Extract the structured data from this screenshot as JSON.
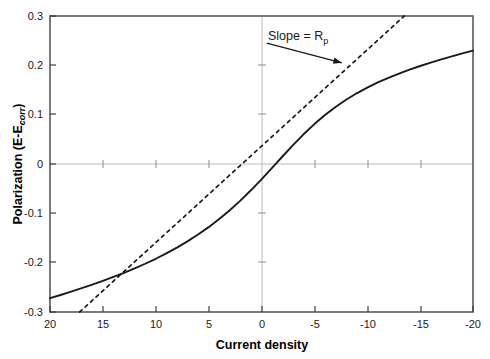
{
  "chart_data": {
    "type": "line",
    "title": "",
    "xlabel": "Current density",
    "ylabel_main": "Polarization (E-E",
    "ylabel_sub": "corr",
    "ylabel_tail": ")",
    "ylabel_full": "Polarization (E-Ecorr)",
    "xlim": [
      20,
      -20
    ],
    "ylim": [
      -0.3,
      0.3
    ],
    "x_ticks": [
      20,
      15,
      10,
      5,
      0,
      -5,
      -10,
      -15,
      -20
    ],
    "x_tick_labels": [
      "20",
      "15",
      "10",
      "5",
      "0",
      "-5",
      "-10",
      "-15",
      "-20"
    ],
    "y_ticks": [
      0.3,
      0.2,
      0.1,
      0,
      -0.1,
      -0.2,
      -0.3
    ],
    "y_tick_labels": [
      "0.3",
      "0.2",
      "0.1",
      "0",
      "-0.1",
      "-0.2",
      "-0.3"
    ],
    "grid": "zero-lines-only",
    "legend": "none",
    "x_axis_reversed": true,
    "series": [
      {
        "name": "polarization-curve",
        "style": "solid",
        "color": "#1a1a1a",
        "x": [
          20,
          19,
          18,
          17,
          16,
          15,
          14,
          13,
          12,
          11,
          10,
          9,
          8,
          7,
          6,
          5,
          4,
          3,
          2,
          1,
          0,
          -1,
          -2,
          -3,
          -4,
          -5,
          -6,
          -7,
          -8,
          -9,
          -10,
          -11,
          -12,
          -13,
          -14,
          -15,
          -16,
          -17,
          -18,
          -19,
          -20
        ],
        "y": [
          -0.272,
          -0.2655,
          -0.2588,
          -0.2518,
          -0.2446,
          -0.237,
          -0.229,
          -0.2206,
          -0.2117,
          -0.2022,
          -0.1921,
          -0.1812,
          -0.1695,
          -0.1568,
          -0.143,
          -0.128,
          -0.1116,
          -0.0937,
          -0.0742,
          -0.0533,
          -0.031,
          -0.0078,
          0.0157,
          0.0388,
          0.0607,
          0.0809,
          0.0993,
          0.1157,
          0.1303,
          0.1433,
          0.1549,
          0.1653,
          0.1747,
          0.1833,
          0.1912,
          0.1986,
          0.2055,
          0.212,
          0.2182,
          0.2241,
          0.2297
        ]
      },
      {
        "name": "tangent-slope-line",
        "style": "dashed",
        "color": "#1a1a1a",
        "x": [
          17.2,
          -13.5
        ],
        "y": [
          -0.3,
          0.3
        ]
      }
    ],
    "annotations": [
      {
        "name": "slope-annotation",
        "text_main": "Slope = R",
        "text_sub": "p",
        "text_full": "Slope = Rp",
        "x_text": 1.5,
        "y_text": 0.255,
        "arrow_from": [
          -0.5,
          0.245
        ],
        "arrow_to": [
          -7.6,
          0.205
        ]
      }
    ]
  }
}
